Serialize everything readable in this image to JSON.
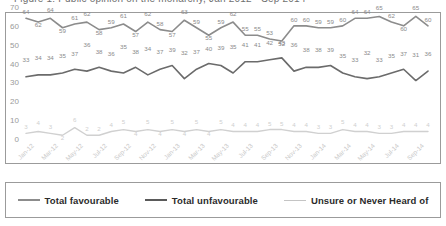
{
  "title": "Figure 1: Public opinion on the monarchy, Jan 2012 - Sep 2014",
  "chart_data": {
    "type": "line",
    "title": "Figure 1: Public opinion on the monarchy, Jan 2012 - Sep 2014",
    "xlabel": "",
    "ylabel": "",
    "ylim": [
      0,
      70
    ],
    "yticks": [
      0,
      10,
      20,
      30,
      40,
      50,
      60,
      70
    ],
    "grid": false,
    "legend_position": "bottom",
    "x": [
      "Jan-12",
      "Feb-12",
      "Mar-12",
      "Apr-12",
      "May-12",
      "Jun-12",
      "Jul-12",
      "Aug-12",
      "Sep-12",
      "Oct-12",
      "Nov-12",
      "Dec-12",
      "Jan-13",
      "Feb-13",
      "Mar-13",
      "Apr-13",
      "May-13",
      "Jun-13",
      "Jul-13",
      "Aug-13",
      "Sep-13",
      "Oct-13",
      "Nov-13",
      "Dec-13",
      "Jan-14",
      "Feb-14",
      "Mar-14",
      "Apr-14",
      "May-14",
      "Jun-14",
      "Jul-14",
      "Aug-14",
      "Sep-14",
      "Oct-14"
    ],
    "xtick_labels": [
      "Jan-12",
      "Mar-12",
      "May-12",
      "Jul-12",
      "Sep-12",
      "Nov-12",
      "Jan-13",
      "Mar-13",
      "May-13",
      "Jul-13",
      "Sep-13",
      "Nov-13",
      "Jan-14",
      "Mar-14",
      "May-14",
      "Jul-14",
      "Sep-14"
    ],
    "xtick_indices": [
      0,
      2,
      4,
      6,
      8,
      10,
      12,
      14,
      16,
      18,
      20,
      22,
      24,
      26,
      28,
      30,
      32
    ],
    "series": [
      {
        "name": "Total favourable",
        "color": "#8c8c8c",
        "width": 1.6,
        "values": [
          64,
          62,
          64,
          59,
          61,
          62,
          58,
          59,
          61,
          57,
          62,
          58,
          57,
          63,
          59,
          55,
          59,
          62,
          55,
          55,
          53,
          52,
          60,
          60,
          59,
          59,
          60,
          64,
          64,
          65,
          62,
          60,
          65,
          60
        ]
      },
      {
        "name": "Total unfavourable",
        "color": "#6b6b6b",
        "width": 1.6,
        "values": [
          33,
          34,
          34,
          35,
          37,
          36,
          38,
          36,
          35,
          38,
          34,
          37,
          39,
          32,
          37,
          40,
          39,
          35,
          41,
          41,
          42,
          43,
          36,
          38,
          38,
          39,
          35,
          33,
          32,
          33,
          35,
          37,
          31,
          36
        ]
      },
      {
        "name": "Unsure or Never Heard of",
        "color": "#d0d0d0",
        "width": 1.4,
        "values": [
          3,
          4,
          3,
          2,
          6,
          2,
          2,
          4,
          5,
          4,
          5,
          4,
          5,
          4,
          5,
          4,
          5,
          4,
          4,
          4,
          5,
          5,
          4,
          4,
          3,
          3,
          5,
          4,
          4,
          3,
          3,
          4,
          4,
          4
        ]
      }
    ]
  },
  "legend": [
    {
      "label": "Total favourable",
      "color": "#8c8c8c",
      "width": 2.2
    },
    {
      "label": "Total unfavourable",
      "color": "#5a5a5a",
      "width": 2.4
    },
    {
      "label": "Unsure or Never Heard of",
      "color": "#c4c4c4",
      "width": 1.6
    }
  ]
}
